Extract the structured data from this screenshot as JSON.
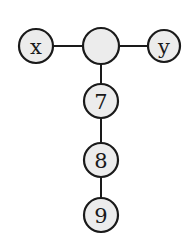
{
  "diagram": {
    "type": "tree",
    "nodes": [
      {
        "id": "x",
        "label": "x",
        "cx": 36,
        "cy": 46,
        "r": 17
      },
      {
        "id": "center",
        "label": "",
        "cx": 101,
        "cy": 46,
        "r": 18
      },
      {
        "id": "y",
        "label": "y",
        "cx": 164,
        "cy": 46,
        "r": 16
      },
      {
        "id": "n7",
        "label": "7",
        "cx": 101,
        "cy": 101,
        "r": 17
      },
      {
        "id": "n8",
        "label": "8",
        "cx": 101,
        "cy": 160,
        "r": 17
      },
      {
        "id": "n9",
        "label": "9",
        "cx": 101,
        "cy": 215,
        "r": 17
      }
    ],
    "edges": [
      {
        "from": "x",
        "to": "center"
      },
      {
        "from": "center",
        "to": "y"
      },
      {
        "from": "center",
        "to": "n7"
      },
      {
        "from": "n7",
        "to": "n8"
      },
      {
        "from": "n8",
        "to": "n9"
      }
    ],
    "colors": {
      "node_fill": "#ececec",
      "stroke": "#1a1a1a",
      "background": "#ffffff"
    }
  }
}
